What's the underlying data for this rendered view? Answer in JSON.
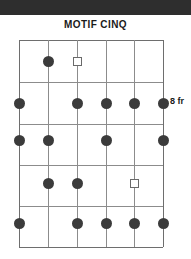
{
  "page": {
    "background_color": "#ffffff",
    "top_band_color": "#2e2e2e"
  },
  "diagram": {
    "title": "MOTIF CINQ",
    "fret_label": "8 fr",
    "type": "guitar-chord-diagram",
    "strings": 6,
    "frets": 5,
    "line_color": "#8c8c8c",
    "dot_color": "#3b3b3b",
    "square_color": "#6a6a6a",
    "string_x": [
      19,
      48,
      77,
      106,
      134,
      163
    ],
    "fret_y": [
      40,
      82,
      124,
      165,
      206,
      247
    ],
    "markers": [
      {
        "kind": "dot",
        "string": 2,
        "fret_y": 61,
        "x": 48,
        "y": 61
      },
      {
        "kind": "square",
        "string": 3,
        "fret_y": 61,
        "x": 77,
        "y": 61
      },
      {
        "kind": "dot",
        "string": 1,
        "fret_y": 103,
        "x": 19,
        "y": 103
      },
      {
        "kind": "dot",
        "string": 3,
        "fret_y": 103,
        "x": 77,
        "y": 103
      },
      {
        "kind": "dot",
        "string": 4,
        "fret_y": 103,
        "x": 106,
        "y": 103
      },
      {
        "kind": "dot",
        "string": 5,
        "fret_y": 103,
        "x": 134,
        "y": 103
      },
      {
        "kind": "dot",
        "string": 6,
        "fret_y": 103,
        "x": 163,
        "y": 103
      },
      {
        "kind": "dot",
        "string": 1,
        "fret_y": 140,
        "x": 19,
        "y": 140
      },
      {
        "kind": "dot",
        "string": 2,
        "fret_y": 140,
        "x": 48,
        "y": 140
      },
      {
        "kind": "dot",
        "string": 4,
        "fret_y": 140,
        "x": 106,
        "y": 140
      },
      {
        "kind": "dot",
        "string": 6,
        "fret_y": 140,
        "x": 163,
        "y": 140
      },
      {
        "kind": "dot",
        "string": 2,
        "fret_y": 183,
        "x": 48,
        "y": 183
      },
      {
        "kind": "dot",
        "string": 3,
        "fret_y": 183,
        "x": 77,
        "y": 183
      },
      {
        "kind": "square",
        "string": 5,
        "fret_y": 183,
        "x": 134,
        "y": 183
      },
      {
        "kind": "dot",
        "string": 1,
        "fret_y": 223,
        "x": 19,
        "y": 223
      },
      {
        "kind": "dot",
        "string": 3,
        "fret_y": 223,
        "x": 77,
        "y": 223
      },
      {
        "kind": "dot",
        "string": 4,
        "fret_y": 223,
        "x": 106,
        "y": 223
      },
      {
        "kind": "dot",
        "string": 5,
        "fret_y": 223,
        "x": 134,
        "y": 223
      },
      {
        "kind": "dot",
        "string": 6,
        "fret_y": 223,
        "x": 163,
        "y": 223
      }
    ]
  }
}
